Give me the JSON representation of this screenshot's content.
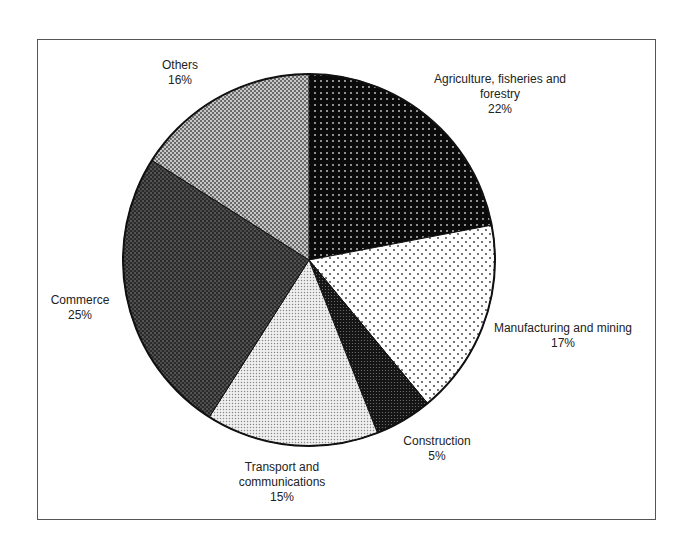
{
  "chart_data": {
    "type": "pie",
    "title": "",
    "start_angle": "12 o'clock",
    "direction": "clockwise",
    "categories": [
      "Agriculture, fisheries and forestry",
      "Manufacturing and mining",
      "Construction",
      "Transport and communications",
      "Commerce",
      "Others"
    ],
    "values": [
      22,
      17,
      5,
      15,
      25,
      16
    ],
    "unit": "%",
    "legend": "none (labels placed next to slices)"
  },
  "labels": [
    {
      "name": "Agriculture, fisheries and",
      "name2": "forestry",
      "pct": "22%"
    },
    {
      "name": "Manufacturing and mining",
      "pct": "17%"
    },
    {
      "name": "Construction",
      "pct": "5%"
    },
    {
      "name": "Transport and",
      "name2": "communications",
      "pct": "15%"
    },
    {
      "name": "Commerce",
      "pct": "25%"
    },
    {
      "name": "Others",
      "pct": "16%"
    }
  ]
}
